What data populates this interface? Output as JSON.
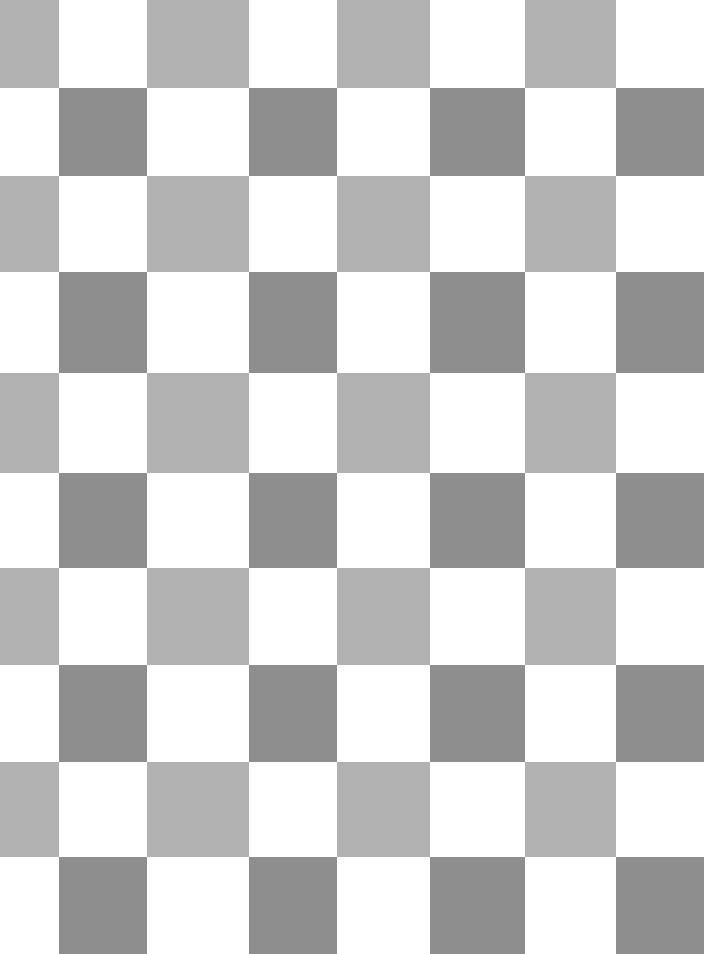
{
  "canvas": {
    "name": "checkerboard-pattern",
    "width": 954,
    "height": 954,
    "pixel_width": 704,
    "pixel_height": 954,
    "background_color": "#ffffff"
  },
  "palette": {
    "white": "#ffffff",
    "light_gray": "#b1b1b1",
    "dark_gray": "#8e8e8e"
  },
  "grid": {
    "columns": 8,
    "rows": 10,
    "column_edges": [
      0,
      59,
      147,
      249,
      337,
      430,
      525,
      616,
      704
    ],
    "row_edges": [
      0,
      88,
      176,
      272,
      373,
      473,
      568,
      665,
      762,
      857,
      954
    ],
    "description": "Alternating checkerboard of white and gray squares; odd rows use light gray, even rows use dark gray"
  },
  "rows": [
    {
      "index": 0,
      "fill": "#b1b1b1",
      "offset": 1,
      "top": 0,
      "bottom": 88
    },
    {
      "index": 1,
      "fill": "#8e8e8e",
      "offset": 0,
      "top": 88,
      "bottom": 176
    },
    {
      "index": 2,
      "fill": "#b1b1b1",
      "offset": 1,
      "top": 176,
      "bottom": 272
    },
    {
      "index": 3,
      "fill": "#8e8e8e",
      "offset": 0,
      "top": 272,
      "bottom": 373
    },
    {
      "index": 4,
      "fill": "#b1b1b1",
      "offset": 1,
      "top": 373,
      "bottom": 473
    },
    {
      "index": 5,
      "fill": "#8e8e8e",
      "offset": 0,
      "top": 473,
      "bottom": 568
    },
    {
      "index": 6,
      "fill": "#b1b1b1",
      "offset": 1,
      "top": 568,
      "bottom": 665
    },
    {
      "index": 7,
      "fill": "#8e8e8e",
      "offset": 0,
      "top": 665,
      "bottom": 762
    },
    {
      "index": 8,
      "fill": "#b1b1b1",
      "offset": 1,
      "top": 762,
      "bottom": 857
    },
    {
      "index": 9,
      "fill": "#8e8e8e",
      "offset": 0,
      "top": 857,
      "bottom": 954
    }
  ]
}
